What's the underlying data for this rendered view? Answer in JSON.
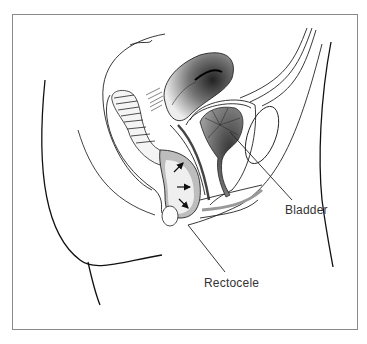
{
  "figure": {
    "labels": {
      "bladder": "Bladder",
      "rectocele": "Rectocele"
    },
    "colors": {
      "line": "#1a1a1a",
      "frame": "#8a8a8a",
      "bulge_fill": "#bdbdbd",
      "organ_dark": "#555555"
    },
    "arrows": {
      "count": 3,
      "direction": "anterior (rectal wall bulging into vagina)"
    }
  }
}
